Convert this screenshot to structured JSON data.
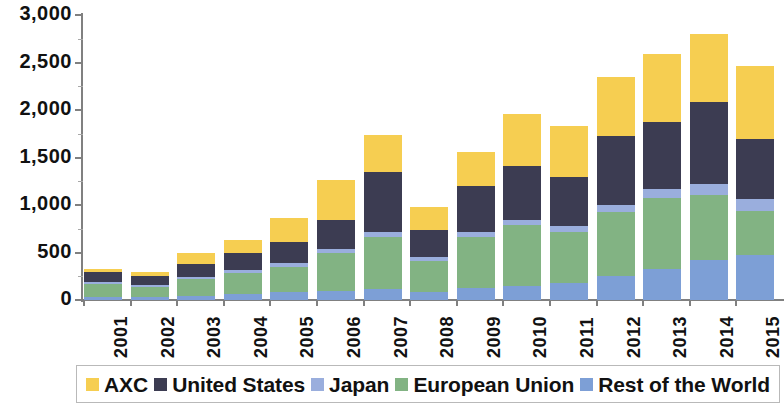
{
  "chart_data": {
    "type": "bar",
    "subtype": "stacked-column",
    "title": "",
    "xlabel": "",
    "ylabel": "",
    "ylim": [
      0,
      3000
    ],
    "ytick_values": [
      0,
      500,
      1000,
      1500,
      2000,
      2500,
      3000
    ],
    "ytick_labels": [
      "0",
      "500",
      "1,000",
      "1,500",
      "2,000",
      "2,500",
      "3,000"
    ],
    "grid": false,
    "legend_position": "bottom",
    "categories": [
      "2001",
      "2002",
      "2003",
      "2004",
      "2005",
      "2006",
      "2007",
      "2008",
      "2009",
      "2010",
      "2011",
      "2012",
      "2013",
      "2014",
      "2015"
    ],
    "series": [
      {
        "name": "Rest of the World",
        "color": "#7d9fd6",
        "values": [
          35,
          30,
          45,
          60,
          80,
          95,
          115,
          85,
          130,
          150,
          180,
          250,
          330,
          420,
          470
        ]
      },
      {
        "name": "European Union",
        "color": "#82b383",
        "values": [
          130,
          110,
          175,
          225,
          270,
          400,
          545,
          330,
          535,
          640,
          540,
          680,
          740,
          690,
          470
        ]
      },
      {
        "name": "Japan",
        "color": "#9aaedd",
        "values": [
          20,
          20,
          25,
          30,
          35,
          40,
          55,
          40,
          50,
          55,
          60,
          75,
          95,
          110,
          125
        ]
      },
      {
        "name": "United States",
        "color": "#3c3c52",
        "values": [
          105,
          95,
          135,
          180,
          230,
          310,
          630,
          285,
          490,
          570,
          520,
          720,
          705,
          860,
          625
        ]
      },
      {
        "name": "AXC",
        "color": "#f6ce51",
        "values": [
          40,
          35,
          110,
          140,
          245,
          415,
          390,
          235,
          350,
          540,
          535,
          625,
          715,
          720,
          770
        ]
      }
    ],
    "totals": [
      330,
      290,
      490,
      635,
      860,
      1260,
      1735,
      975,
      1555,
      1955,
      1835,
      2350,
      2585,
      2800,
      2460
    ]
  },
  "legend": {
    "items": [
      {
        "label": "AXC",
        "color": "#f6ce51"
      },
      {
        "label": "United States",
        "color": "#3c3c52"
      },
      {
        "label": "Japan",
        "color": "#9aaedd"
      },
      {
        "label": "European Union",
        "color": "#82b383"
      },
      {
        "label": "Rest of the World",
        "color": "#7d9fd6"
      }
    ]
  }
}
